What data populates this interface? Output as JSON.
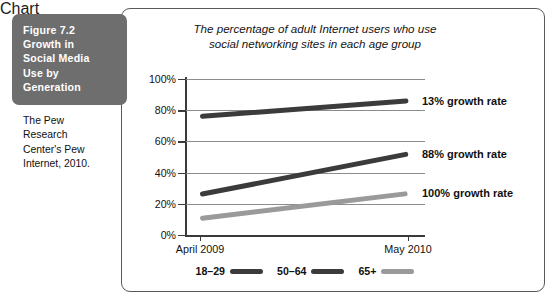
{
  "figure": {
    "label_lines": [
      "Figure 7.2",
      "Growth in",
      "Social Media",
      "Use by",
      "Generation"
    ],
    "source_lines": [
      "The Pew",
      "Research",
      "Center's Pew",
      "Internet, 2010."
    ],
    "box_color": "#6e6e6e"
  },
  "chart_data": {
    "type": "line",
    "title_lines": [
      "The percentage of adult Internet users who use",
      "social networking sites in each age group"
    ],
    "xlabel": "",
    "ylabel": "",
    "x": [
      "April 2009",
      "May 2010"
    ],
    "categories": [
      "April 2009",
      "May 2010"
    ],
    "ylim": [
      0,
      100
    ],
    "yticks": [
      0,
      20,
      40,
      60,
      80,
      100
    ],
    "ytick_labels": [
      "0%",
      "20%",
      "40%",
      "60%",
      "80%",
      "100%"
    ],
    "grid": true,
    "legend_position": "bottom",
    "series": [
      {
        "name": "18–29",
        "values": [
          76,
          86
        ],
        "color": "#3b3b3b",
        "annotation": "13% growth rate"
      },
      {
        "name": "50–64",
        "values": [
          26,
          52
        ],
        "color": "#3b3b3b",
        "annotation": "88% growth rate"
      },
      {
        "name": "65+",
        "values": [
          11,
          27
        ],
        "color": "#9a9a9a",
        "annotation": "100% growth rate"
      }
    ],
    "annotations": [
      {
        "text": "13% growth rate",
        "series": "18–29"
      },
      {
        "text": "88% growth rate",
        "series": "50–64"
      },
      {
        "text": "100% growth rate",
        "series": "65+"
      }
    ],
    "legend": [
      {
        "label": "18–29",
        "color": "#3b3b3b"
      },
      {
        "label": "50–64",
        "color": "#3b3b3b"
      },
      {
        "label": "65+",
        "color": "#9a9a9a"
      }
    ]
  }
}
